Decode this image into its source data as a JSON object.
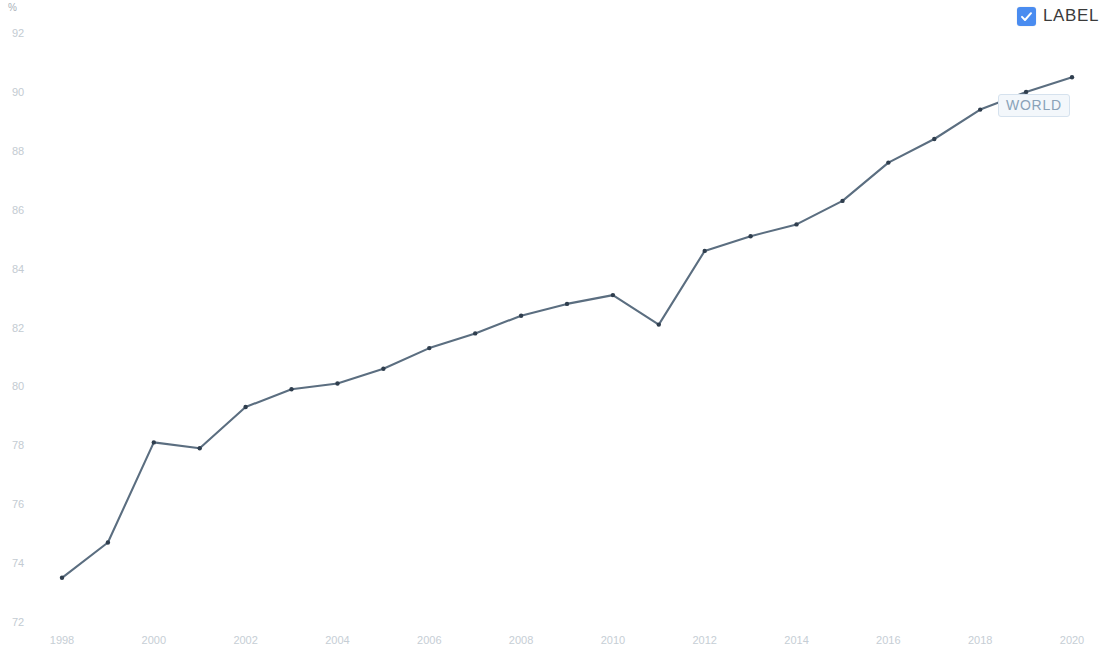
{
  "legend": {
    "checkbox_checked": true,
    "label": "LABEL",
    "checkbox_color": "#4a8cf0",
    "icon": "checkbox-checked-icon"
  },
  "annotation": {
    "label": "WORLD",
    "attached_year": 2019
  },
  "chart_data": {
    "type": "line",
    "title": "",
    "subtitle": "",
    "xlabel": "",
    "ylabel": "%",
    "unit_label": "%",
    "grid": false,
    "legend_position": "top-right",
    "series_name": "WORLD",
    "line_color": "#5b6e80",
    "point_color": "#2f3e4e",
    "x": [
      1998,
      1999,
      2000,
      2001,
      2002,
      2003,
      2004,
      2005,
      2006,
      2007,
      2008,
      2009,
      2010,
      2011,
      2012,
      2013,
      2014,
      2015,
      2016,
      2017,
      2018,
      2019,
      2020
    ],
    "values": [
      73.5,
      74.7,
      78.1,
      77.9,
      79.3,
      79.9,
      80.1,
      80.6,
      81.3,
      81.8,
      82.4,
      82.8,
      83.1,
      82.1,
      84.6,
      85.1,
      85.5,
      86.3,
      87.6,
      88.4,
      89.4,
      90.0,
      90.5
    ],
    "xticks": [
      1998,
      2000,
      2002,
      2004,
      2006,
      2008,
      2010,
      2012,
      2014,
      2016,
      2018,
      2020
    ],
    "xtick_labels": [
      "1998",
      "2000",
      "2002",
      "2004",
      "2006",
      "2008",
      "2010",
      "2012",
      "2014",
      "2016",
      "2018",
      "2020"
    ],
    "yticks": [
      72,
      74,
      76,
      78,
      80,
      82,
      84,
      86,
      88,
      90,
      92
    ],
    "ytick_labels": [
      "72",
      "74",
      "76",
      "78",
      "80",
      "82",
      "84",
      "86",
      "88",
      "90",
      "92"
    ],
    "xlim": [
      1997.5,
      2020.5
    ],
    "ylim": [
      72,
      92
    ]
  }
}
